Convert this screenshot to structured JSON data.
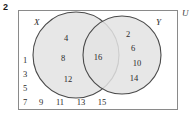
{
  "question_number": "2",
  "universe_label": "U",
  "sets": {
    "left": {
      "label": "X",
      "elements": [
        "4",
        "8",
        "12"
      ]
    },
    "right": {
      "label": "Y",
      "elements": [
        "2",
        "6",
        "10",
        "14"
      ]
    },
    "intersection": {
      "elements": [
        "16"
      ]
    },
    "outside": {
      "column": [
        "1",
        "3",
        "5",
        "7"
      ],
      "row": [
        "9",
        "11",
        "13",
        "15"
      ]
    }
  },
  "colors": {
    "circle_fill": "#e3e3e3",
    "circle_stroke": "#4a4a4a",
    "box_stroke": "#8a8a8a",
    "text": "#2b2b2b"
  },
  "positions": {
    "left_circle_elements": [
      {
        "x": 66,
        "y": 38
      },
      {
        "x": 63,
        "y": 58
      },
      {
        "x": 68,
        "y": 79
      }
    ],
    "right_circle_elements": [
      {
        "x": 128,
        "y": 34
      },
      {
        "x": 133,
        "y": 48
      },
      {
        "x": 137,
        "y": 63
      },
      {
        "x": 134,
        "y": 78
      }
    ],
    "intersection_elements": [
      {
        "x": 98,
        "y": 57
      }
    ],
    "outside_column": [
      {
        "x": 24,
        "y": 60
      },
      {
        "x": 24,
        "y": 74
      },
      {
        "x": 24,
        "y": 88
      },
      {
        "x": 24,
        "y": 102
      }
    ],
    "outside_row": [
      {
        "x": 40,
        "y": 102
      },
      {
        "x": 59,
        "y": 102
      },
      {
        "x": 80,
        "y": 102
      },
      {
        "x": 101,
        "y": 102
      }
    ]
  },
  "geometry": {
    "left_circle": {
      "cx": 72,
      "cy": 48,
      "r": 43
    },
    "right_circle": {
      "cx": 118,
      "cy": 48,
      "r": 39
    }
  }
}
